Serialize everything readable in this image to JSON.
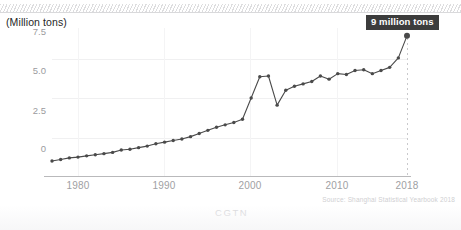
{
  "chart_data": {
    "type": "line",
    "title": "",
    "subtitle": "",
    "unit_label": "(Million tons)",
    "xlabel": "",
    "ylabel": "Million tons",
    "xlim": [
      1977,
      2018
    ],
    "ylim": [
      0,
      9.4
    ],
    "grid": true,
    "legend": null,
    "y_ticks": [
      "0",
      "2.5",
      "5.0",
      "7.5"
    ],
    "y_tick_values": [
      0,
      2.5,
      5.0,
      7.5
    ],
    "x_ticks": [
      "1980",
      "1990",
      "2000",
      "2010",
      "2018"
    ],
    "x_tick_values": [
      1980,
      1990,
      2000,
      2010,
      2018
    ],
    "series": [
      {
        "name": "Shanghai municipal solid waste",
        "color": "#4a4a4a",
        "marker": "circle",
        "x": [
          1977,
          1978,
          1979,
          1980,
          1981,
          1982,
          1983,
          1984,
          1985,
          1986,
          1987,
          1988,
          1989,
          1990,
          1991,
          1992,
          1993,
          1994,
          1995,
          1996,
          1997,
          1998,
          1999,
          2000,
          2001,
          2002,
          2003,
          2004,
          2005,
          2006,
          2007,
          2008,
          2009,
          2010,
          2011,
          2012,
          2013,
          2014,
          2015,
          2016,
          2017,
          2018
        ],
        "values": [
          0.95,
          1.05,
          1.15,
          1.2,
          1.28,
          1.35,
          1.42,
          1.5,
          1.65,
          1.7,
          1.8,
          1.9,
          2.05,
          2.15,
          2.25,
          2.35,
          2.5,
          2.7,
          2.9,
          3.1,
          3.25,
          3.4,
          3.6,
          4.95,
          6.3,
          6.35,
          4.5,
          5.45,
          5.7,
          5.85,
          6.0,
          6.35,
          6.15,
          6.5,
          6.45,
          6.7,
          6.75,
          6.5,
          6.7,
          6.9,
          7.5,
          8.9
        ]
      }
    ],
    "annotations": [
      {
        "label": "9 million tons",
        "x": 2018,
        "y": 8.9,
        "style": "dark-box"
      }
    ],
    "reference_lines": [
      {
        "orientation": "vertical",
        "x": 2018,
        "style": "dotted"
      }
    ],
    "source": "Source: Shanghai Statistical Yearbook 2018",
    "watermark": "CGTN"
  }
}
